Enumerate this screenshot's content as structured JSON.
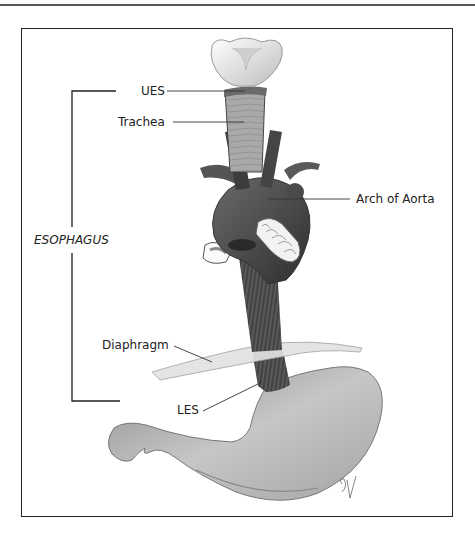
{
  "figure": {
    "type": "anatomical-diagram",
    "bracket_label": "ESOPHAGUS",
    "labels": {
      "ues": "UES",
      "trachea": "Trachea",
      "arch_of_aorta": "Arch of Aorta",
      "diaphragm": "Diaphragm",
      "les": "LES"
    },
    "signature": "SV",
    "colors": {
      "frame": "#222222",
      "esophagus_muscle": "#4a4a4a",
      "aorta": "#5e5e5e",
      "trachea": "#a8a8a8",
      "stomach": "#b8b8b8",
      "diaphragm": "#dcdcdc",
      "larynx": "#f0f0f0"
    }
  }
}
